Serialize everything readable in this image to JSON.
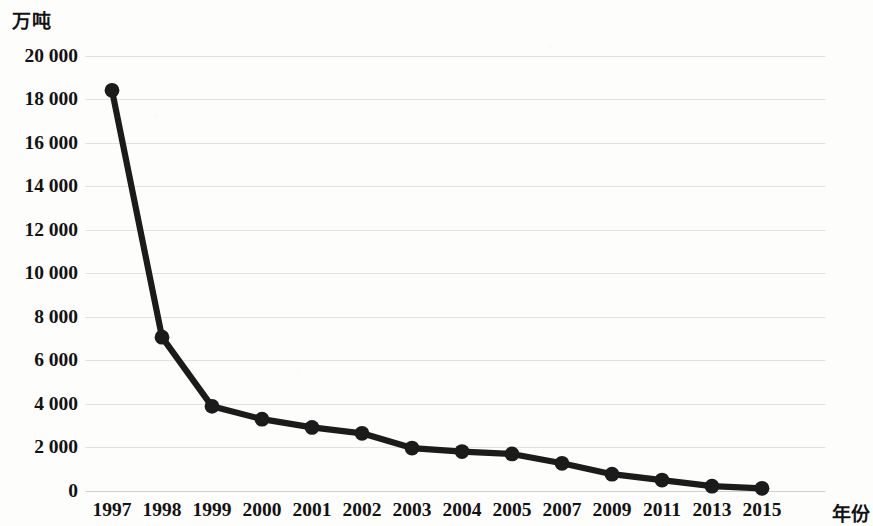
{
  "chart_data": {
    "type": "line",
    "title": "",
    "subtitle": "",
    "ylabel": "万吨",
    "xlabel": "年份",
    "categories": [
      "1997",
      "1998",
      "1999",
      "2000",
      "2001",
      "2002",
      "2003",
      "2004",
      "2005",
      "2007",
      "2009",
      "2011",
      "2013",
      "2015"
    ],
    "values": [
      18400,
      7050,
      3870,
      3280,
      2900,
      2630,
      1950,
      1790,
      1680,
      1250,
      750,
      480,
      200,
      100
    ],
    "series": [
      {
        "name": "",
        "values": [
          18400,
          7050,
          3870,
          3280,
          2900,
          2630,
          1950,
          1790,
          1680,
          1250,
          750,
          480,
          200,
          100
        ]
      }
    ],
    "ylim": [
      0,
      20000
    ],
    "ytick_values": [
      0,
      2000,
      4000,
      6000,
      8000,
      10000,
      12000,
      14000,
      16000,
      18000,
      20000
    ],
    "ytick_labels": [
      "0",
      "2 000",
      "4 000",
      "6 000",
      "8 000",
      "10 000",
      "12 000",
      "14 000",
      "16 000",
      "18 000",
      "20 000"
    ],
    "xtick_labels": [
      "1997",
      "1998",
      "1999",
      "2000",
      "2001",
      "2002",
      "2003",
      "2004",
      "2005",
      "2007",
      "2009",
      "2011",
      "2013",
      "2015"
    ],
    "grid": true,
    "legend": "none",
    "marker": "circle",
    "line_color": "#1b1b1b",
    "marker_color": "#1b1b1b",
    "grid_color": "#e2e2e2",
    "background_color": "#fdfdfc"
  }
}
